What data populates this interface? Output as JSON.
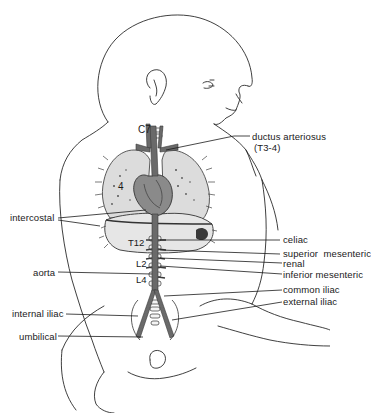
{
  "figure": {
    "colors": {
      "outline": "#2a2a2a",
      "vessel": "#6a6a6a",
      "vessel_dark": "#4a4a4a",
      "lung_fill": "#dcdcdc",
      "diaphragm_fill": "#e6e6e6",
      "spine": "#f4f4f4"
    },
    "vertebra_labels": [
      {
        "text": "C7"
      },
      {
        "text": "T12"
      },
      {
        "text": "L2"
      },
      {
        "text": "L4"
      }
    ],
    "lung_marker": {
      "text": "4"
    },
    "labels_right": [
      {
        "text": "ductus arteriosus",
        "sub": "(T3-4)"
      },
      {
        "text": "celiac"
      },
      {
        "text": "superior  mesenteric"
      },
      {
        "text": "renal"
      },
      {
        "text": "inferior mesenteric"
      },
      {
        "text": "common iliac"
      },
      {
        "text": "external iliac"
      }
    ],
    "labels_left": [
      {
        "text": "intercostal"
      },
      {
        "text": "aorta"
      },
      {
        "text": "internal iliac"
      },
      {
        "text": "umbilical"
      }
    ]
  }
}
